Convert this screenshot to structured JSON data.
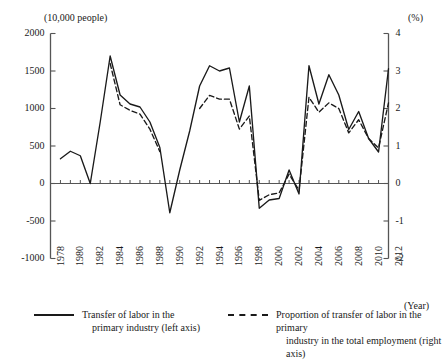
{
  "chart_data": {
    "type": "line",
    "title": "",
    "xlabel": "(Year)",
    "ylabel_left": "(10,000 people)",
    "ylabel_right": "(%)",
    "grid": false,
    "legend_position": "bottom",
    "x": [
      1979,
      1980,
      1981,
      1982,
      1983,
      1984,
      1985,
      1986,
      1987,
      1988,
      1989,
      1990,
      1991,
      1992,
      1993,
      1994,
      1995,
      1996,
      1997,
      1998,
      1999,
      2000,
      2001,
      2002,
      2003,
      2004,
      2005,
      2006,
      2007,
      2008,
      2009,
      2010,
      2011,
      2012
    ],
    "xlim": [
      1978,
      2012
    ],
    "xticks": [
      1978,
      1980,
      1982,
      1984,
      1986,
      1988,
      1990,
      1992,
      1994,
      1996,
      1998,
      2000,
      2002,
      2004,
      2006,
      2008,
      2010,
      2012
    ],
    "ylim_left": [
      -1000,
      2000
    ],
    "yticks_left": [
      2000,
      1500,
      1000,
      500,
      0,
      -500,
      -1000
    ],
    "ylim_right": [
      -2,
      4
    ],
    "yticks_right": [
      4,
      3,
      2,
      1,
      0,
      -1,
      -2
    ],
    "series": [
      {
        "name": "Transfer of labor in the primary industry (left axis)",
        "axis": "left",
        "style": "solid",
        "color": "#1a1a1a",
        "values": [
          330,
          430,
          370,
          0,
          820,
          1700,
          1180,
          1060,
          1020,
          820,
          480,
          -390,
          180,
          700,
          1300,
          1570,
          1500,
          1540,
          820,
          1300,
          -330,
          -220,
          -200,
          180,
          -140,
          1570,
          1060,
          1450,
          1180,
          720,
          960,
          600,
          420,
          1530
        ]
      },
      {
        "name": "Proportion of transfer of labor in the primary industry in the total employment (right axis)",
        "axis": "right",
        "style": "dashed",
        "color": "#1a1a1a",
        "values": [
          null,
          null,
          null,
          null,
          null,
          3.2,
          2.1,
          1.95,
          1.85,
          1.45,
          0.85,
          null,
          null,
          null,
          2.0,
          2.35,
          2.25,
          2.25,
          1.45,
          1.8,
          -0.45,
          -0.3,
          -0.25,
          0.25,
          -0.18,
          2.3,
          1.9,
          2.15,
          2.0,
          1.35,
          1.7,
          1.2,
          0.95,
          2.15
        ]
      }
    ]
  },
  "axes": {
    "left_unit": "(10,000 people)",
    "right_unit": "(%)",
    "x_unit": "(Year)",
    "left_ticks": [
      "2000",
      "1500",
      "1000",
      "500",
      "0",
      "-500",
      "-1000"
    ],
    "right_ticks": [
      "4",
      "3",
      "2",
      "1",
      "0",
      "-1",
      "-2"
    ],
    "x_ticks": [
      "1978",
      "1980",
      "1982",
      "1984",
      "1986",
      "1988",
      "1990",
      "1992",
      "1994",
      "1996",
      "1998",
      "2000",
      "2002",
      "2004",
      "2006",
      "2008",
      "2010",
      "2012"
    ]
  },
  "legend": {
    "solid": {
      "line1": "Transfer of labor in the",
      "line2": "primary industry (left axis)"
    },
    "dashed": {
      "line1": "Proportion of transfer of labor in the primary",
      "line2": "industry in the total employment (right axis)"
    }
  },
  "colors": {
    "line": "#1a1a1a",
    "axis": "#555555",
    "background": "#ffffff"
  }
}
